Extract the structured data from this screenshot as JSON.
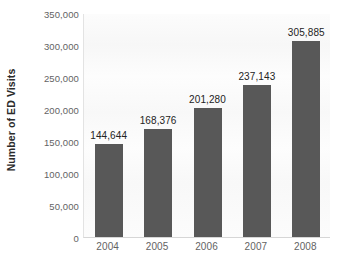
{
  "chart_data": {
    "type": "bar",
    "title": "",
    "xlabel": "",
    "ylabel": "Number of ED Visits",
    "categories": [
      "2004",
      "2005",
      "2006",
      "2007",
      "2008"
    ],
    "values": [
      144644,
      168376,
      201280,
      237143,
      305885
    ],
    "value_labels": [
      "144,644",
      "168,376",
      "201,280",
      "237,143",
      "305,885"
    ],
    "ylim": [
      0,
      350000
    ],
    "ytick_values": [
      0,
      50000,
      100000,
      150000,
      200000,
      250000,
      300000,
      350000
    ],
    "ytick_labels": [
      "0",
      "50,000",
      "100,000",
      "150,000",
      "200,000",
      "250,000",
      "300,000",
      "350,000"
    ],
    "grid": false,
    "legend": null,
    "bar_color": "#585858",
    "plot_background": "#fbfbfb",
    "page_background": "#ffffff",
    "axis_label_color": "#636363",
    "value_label_color": "#232323"
  }
}
